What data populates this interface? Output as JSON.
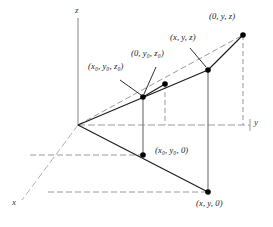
{
  "figure": {
    "background_color": "#ffffff",
    "solid_line_color": "#1a1a1a",
    "dashed_line_color": "#8c8c8c",
    "axis_color": "#9a9a9a",
    "marker_color": "#000000",
    "width": 273,
    "height": 227
  },
  "axes": [
    {
      "name": "z-axis",
      "label": "z",
      "label_x": 76,
      "label_y": 8
    },
    {
      "name": "y-axis",
      "label": "y",
      "label_x": 256,
      "label_y": 120
    },
    {
      "name": "x-axis",
      "label": "x",
      "label_x": 13,
      "label_y": 205
    }
  ],
  "points": [
    {
      "name": "origin",
      "label": "",
      "x": 78,
      "y": 125,
      "marker": false
    },
    {
      "name": "point-x0-y0-z0",
      "label": "(x₀, y₀, z₀)",
      "label_x": 88,
      "label_y": 68,
      "x": 143,
      "y": 97,
      "marker": true
    },
    {
      "name": "point-0-y0-z0",
      "label": "(0, y₀, z₀)",
      "label_x": 131,
      "label_y": 55,
      "x": 165,
      "y": 84,
      "marker": true
    },
    {
      "name": "point-x-y-z",
      "label": "(x, y, z)",
      "label_x": 170,
      "label_y": 38,
      "x": 208,
      "y": 70,
      "marker": true
    },
    {
      "name": "point-0-y-z",
      "label": "(0, y, z)",
      "label_x": 209,
      "label_y": 15,
      "x": 243,
      "y": 35,
      "marker": true
    },
    {
      "name": "point-x0-y0-0",
      "label": "(x₀, y₀, 0)",
      "label_x": 155,
      "label_y": 149,
      "x": 143,
      "y": 155,
      "marker": true
    },
    {
      "name": "point-x-y-0",
      "label": "(x, y, 0)",
      "label_x": 196,
      "label_y": 205,
      "x": 208,
      "y": 192,
      "marker": true
    }
  ],
  "labels": {
    "x0y0z0": "(x₀, y₀, z₀)",
    "zero_y0z0": "(0, y₀, z₀)",
    "xyz": "(x, y, z)",
    "zero_yz": "(0, y, z)",
    "x0y00": "(x₀, y₀, 0)",
    "xy0": "(x, y, 0)",
    "axis_x": "x",
    "axis_y": "y",
    "axis_z": "z"
  }
}
